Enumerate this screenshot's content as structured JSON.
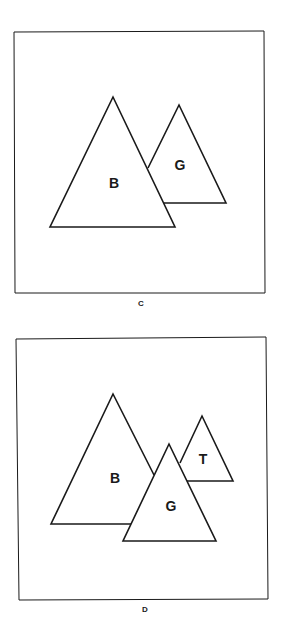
{
  "panels": [
    {
      "caption": "C",
      "shapes": [
        {
          "label": "B",
          "type": "triangle"
        },
        {
          "label": "G",
          "type": "triangle"
        }
      ]
    },
    {
      "caption": "D",
      "shapes": [
        {
          "label": "B",
          "type": "triangle"
        },
        {
          "label": "G",
          "type": "triangle"
        },
        {
          "label": "T",
          "type": "triangle"
        }
      ]
    }
  ],
  "colors": {
    "stroke": "#1a1a1a",
    "background": "#ffffff"
  }
}
